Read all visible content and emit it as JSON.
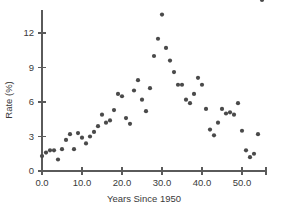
{
  "chart_data": {
    "type": "scatter",
    "title": "",
    "xlabel": "Years Since 1950",
    "ylabel": "Rate (%)",
    "xlim": [
      -1.5,
      57.0
    ],
    "ylim": [
      -0.6,
      14.2
    ],
    "xticks": [
      0.0,
      10.0,
      20.0,
      30.0,
      40.0,
      50.0
    ],
    "xtick_labels": [
      "0.0",
      "10.0",
      "20.0",
      "30.0",
      "40.0",
      "50.0"
    ],
    "yticks": [
      0,
      3,
      6,
      9,
      12
    ],
    "ytick_labels": [
      "0",
      "3",
      "6",
      "9",
      "12"
    ],
    "grid": false,
    "legend": null,
    "marker": "filled-circle",
    "marker_color": "#4a4a4a",
    "marker_size": 2.1,
    "point_count": 56,
    "x": [
      0,
      1,
      2,
      3,
      4,
      5,
      6,
      7,
      8,
      9,
      10,
      11,
      12,
      13,
      14,
      15,
      16,
      17,
      18,
      19,
      20,
      21,
      22,
      23,
      24,
      25,
      26,
      27,
      28,
      29,
      30,
      31,
      32,
      33,
      34,
      35,
      36,
      37,
      38,
      39,
      40,
      41,
      42,
      43,
      44,
      45,
      46,
      47,
      48,
      49,
      50,
      51,
      52,
      53,
      54,
      55
    ],
    "y": [
      1.3,
      1.6,
      1.8,
      1.8,
      1.0,
      1.9,
      2.7,
      3.2,
      1.9,
      3.3,
      2.9,
      2.4,
      3.0,
      3.4,
      3.9,
      4.9,
      4.2,
      4.4,
      5.3,
      6.7,
      6.5,
      4.6,
      4.1,
      7.0,
      7.9,
      6.2,
      5.2,
      7.2,
      10.0,
      11.5,
      13.6,
      10.7,
      9.6,
      8.6,
      7.5,
      7.5,
      6.2,
      5.9,
      6.7,
      8.1,
      7.5,
      5.4,
      3.6,
      3.1,
      4.2,
      5.4,
      5.0,
      5.1,
      4.9,
      5.9,
      3.5,
      1.8,
      1.2,
      1.5,
      3.2
    ],
    "series_name": "rate"
  },
  "axes": {
    "x_title": "Years Since 1950",
    "y_title": "Rate (%)"
  }
}
